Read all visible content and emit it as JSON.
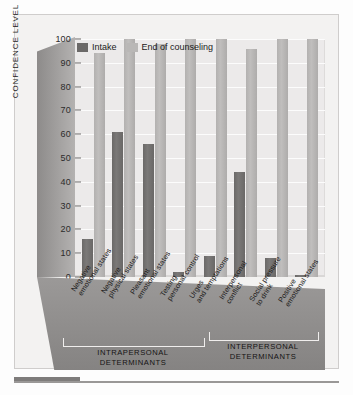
{
  "figure": {
    "y_axis_title": "CONFIDENCE LEVEL"
  },
  "legend": {
    "items": [
      {
        "label": "Intake",
        "color": "#6b6968",
        "key": "intake"
      },
      {
        "label": "End of counseling",
        "color": "#b9b7b6",
        "key": "end"
      }
    ]
  },
  "groups": [
    {
      "name": "INTRAPERSONAL DETERMINANTS",
      "line1": "INTRAPERSONAL",
      "line2": "DETERMINANTS"
    },
    {
      "name": "INTERPERSONAL DETERMINANTS",
      "line1": "INTERPERSONAL",
      "line2": "DETERMINANTS"
    }
  ],
  "categories_wrapped": [
    [
      "Negative",
      "emotional states"
    ],
    [
      "Negative",
      "physical states"
    ],
    [
      "Pleasant",
      "emotional states"
    ],
    [
      "Testing",
      "personal control"
    ],
    [
      "Urges",
      "and temptations"
    ],
    [
      "Interpersonal",
      "conflict"
    ],
    [
      "Social pressure",
      "to drink"
    ],
    [
      "Positive",
      "emotional states"
    ]
  ],
  "chart_data": {
    "type": "bar",
    "title": "",
    "xlabel": "",
    "ylabel": "CONFIDENCE LEVEL",
    "ylim": [
      0,
      100
    ],
    "ytick_step": 10,
    "yticks": [
      0,
      10,
      20,
      30,
      40,
      50,
      60,
      70,
      80,
      90,
      100
    ],
    "grid": true,
    "legend_position": "top-left",
    "categories": [
      "Negative emotional states",
      "Negative physical states",
      "Pleasant emotional states",
      "Testing personal control",
      "Urges and temptations",
      "Interpersonal conflict",
      "Social pressure to drink",
      "Positive emotional states"
    ],
    "category_groups": [
      {
        "label": "INTRAPERSONAL DETERMINANTS",
        "categories": [
          0,
          1,
          2,
          3,
          4
        ]
      },
      {
        "label": "INTERPERSONAL DETERMINANTS",
        "categories": [
          5,
          6,
          7
        ]
      }
    ],
    "series": [
      {
        "name": "Intake",
        "color": "#6b6968",
        "values": [
          16,
          61,
          56,
          2,
          9,
          44,
          8,
          1
        ]
      },
      {
        "name": "End of counseling",
        "color": "#b9b7b6",
        "values": [
          94,
          100,
          98,
          100,
          100,
          96,
          100,
          100
        ]
      }
    ]
  }
}
